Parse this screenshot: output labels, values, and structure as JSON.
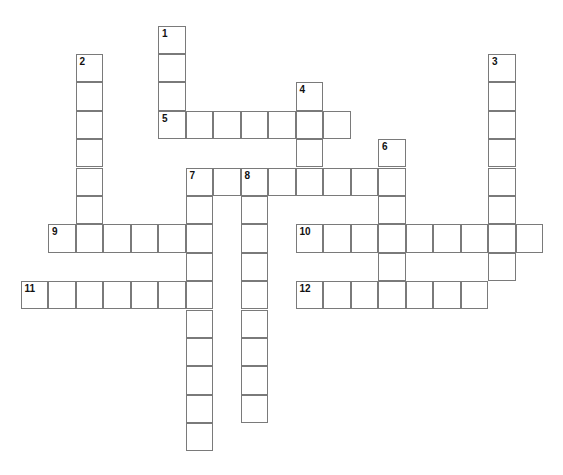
{
  "puzzle": {
    "cell_size": 27.5,
    "row_height": 28.4,
    "origin_x": 21,
    "origin_y": 26,
    "border_color": "#7a7a7a",
    "clues": [
      {
        "number": "1",
        "direction": "down",
        "col": 5,
        "row": 0,
        "length": 4
      },
      {
        "number": "2",
        "direction": "down",
        "col": 2,
        "row": 1,
        "length": 7
      },
      {
        "number": "3",
        "direction": "down",
        "col": 17,
        "row": 1,
        "length": 8
      },
      {
        "number": "4",
        "direction": "down",
        "col": 10,
        "row": 2,
        "length": 4
      },
      {
        "number": "5",
        "direction": "across",
        "col": 5,
        "row": 3,
        "length": 7
      },
      {
        "number": "6",
        "direction": "down",
        "col": 13,
        "row": 4,
        "length": 6
      },
      {
        "number": "7",
        "direction": "down",
        "col": 6,
        "row": 5,
        "length": 10
      },
      {
        "number": "7",
        "direction": "across",
        "col": 6,
        "row": 5,
        "length": 8
      },
      {
        "number": "8",
        "direction": "down",
        "col": 8,
        "row": 5,
        "length": 9
      },
      {
        "number": "9",
        "direction": "across",
        "col": 1,
        "row": 7,
        "length": 6
      },
      {
        "number": "10",
        "direction": "across",
        "col": 10,
        "row": 7,
        "length": 9
      },
      {
        "number": "11",
        "direction": "across",
        "col": 0,
        "row": 9,
        "length": 7
      },
      {
        "number": "12",
        "direction": "across",
        "col": 10,
        "row": 9,
        "length": 7
      }
    ]
  }
}
